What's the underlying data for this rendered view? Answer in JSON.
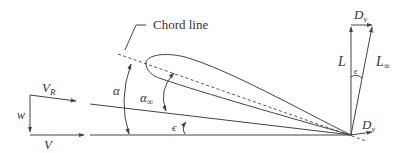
{
  "diagram": {
    "chord_label": "Chord line",
    "labels": {
      "VR": "V",
      "VR_sub": "R",
      "w": "w",
      "V": "V",
      "alpha": "α",
      "alpha_inf": "α",
      "alpha_inf_sub": "∞",
      "epsilon_angle": "ϵ",
      "epsilon_forces": "ϵ",
      "L": "L",
      "L_inf": "L",
      "L_inf_sub": "∞",
      "Dv_top": "D",
      "Dv_top_sub": "v",
      "Dv_bottom": "D",
      "Dv_bottom_sub": "v"
    },
    "colors": {
      "line": "#444444",
      "text": "#333333",
      "background": "#ffffff"
    }
  }
}
